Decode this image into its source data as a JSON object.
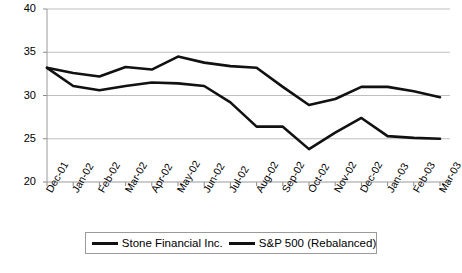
{
  "chart_data": {
    "type": "line",
    "title": "",
    "subtitle": "",
    "xlabel": "",
    "ylabel": "",
    "grid": true,
    "legend_position": "bottom",
    "ylim": [
      20,
      40
    ],
    "yticks": [
      20,
      25,
      30,
      35,
      40
    ],
    "ytick_labels": [
      "20",
      "25",
      "30",
      "35",
      "40"
    ],
    "categories": [
      "Dec-01",
      "Jan-02",
      "Feb-02",
      "Mar-02",
      "Apr-02",
      "May-02",
      "Jun-02",
      "Jul-02",
      "Aug-02",
      "Sep-02",
      "Oct-02",
      "Nov-02",
      "Dec-02",
      "Jan-03",
      "Feb-03",
      "Mar-03"
    ],
    "series": [
      {
        "name": "Stone Financial Inc.",
        "color": "#111111",
        "values": [
          33.2,
          32.6,
          32.2,
          33.3,
          33.0,
          34.5,
          33.8,
          33.4,
          33.2,
          31.0,
          28.9,
          29.6,
          31.0,
          31.0,
          30.5,
          29.8
        ]
      },
      {
        "name": "S&P 500 (Rebalanced)",
        "color": "#111111",
        "values": [
          33.2,
          31.1,
          30.6,
          31.1,
          31.5,
          31.4,
          31.1,
          29.2,
          26.4,
          26.4,
          23.8,
          25.7,
          27.4,
          25.3,
          25.1,
          25.0
        ]
      }
    ]
  },
  "legend": {
    "entries": [
      {
        "label": "Stone Financial Inc."
      },
      {
        "label": "S&P 500 (Rebalanced)"
      }
    ]
  }
}
